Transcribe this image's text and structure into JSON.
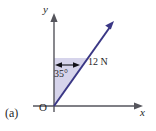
{
  "figure": {
    "part_label": "(a)",
    "axes": {
      "x_label": "x",
      "y_label": "y",
      "origin_label": "O"
    },
    "vector": {
      "magnitude_label": "12 N",
      "angle_label": "35°",
      "angle_degrees": 35,
      "magnitude_value": 12,
      "unit": "N",
      "measured_from": "y-axis",
      "direction": "up-and-to-the-right"
    },
    "colors": {
      "vector": "#3a3785",
      "sector_fill": "#cfcde8",
      "axis": "#55555c",
      "text": "#1f1f28",
      "background": "#ffffff"
    }
  }
}
